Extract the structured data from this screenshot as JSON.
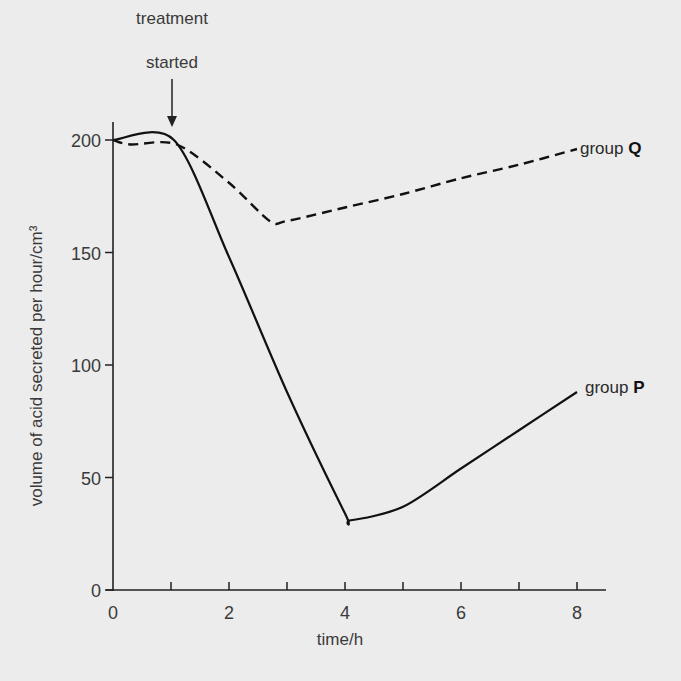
{
  "chart_data": {
    "type": "line",
    "title": "",
    "xlabel": "time/h",
    "ylabel": "volume of acid secreted per hour/cm³",
    "xlim": [
      0,
      8.5
    ],
    "ylim": [
      0,
      200
    ],
    "x_ticks": [
      0,
      1,
      2,
      3,
      4,
      5,
      6,
      7,
      8
    ],
    "x_tick_labels": [
      "0",
      "2",
      "4",
      "6",
      "8"
    ],
    "y_ticks": [
      0,
      50,
      100,
      150,
      200
    ],
    "y_tick_labels": [
      "0",
      "50",
      "100",
      "150",
      "200"
    ],
    "grid": false,
    "legend": "inline labels at line ends",
    "annotations": [
      {
        "text_line1": "treatment",
        "text_line2": "started",
        "x": 1,
        "arrow": "down"
      }
    ],
    "series": [
      {
        "name": "group P",
        "label_prefix": "group ",
        "label_letter": "P",
        "style": "solid",
        "x": [
          0,
          1.05,
          2,
          3,
          4,
          4.1,
          5,
          6,
          7,
          8
        ],
        "values": [
          200,
          200,
          148,
          88,
          34,
          31,
          37,
          54,
          71,
          88
        ]
      },
      {
        "name": "group Q",
        "label_prefix": "group ",
        "label_letter": "Q",
        "style": "dashed",
        "x": [
          0,
          0.3,
          1.1,
          2,
          2.7,
          3,
          4,
          5,
          6,
          7,
          8
        ],
        "values": [
          200,
          198,
          198,
          181,
          164,
          164,
          170,
          176,
          183,
          189,
          196
        ]
      }
    ]
  }
}
